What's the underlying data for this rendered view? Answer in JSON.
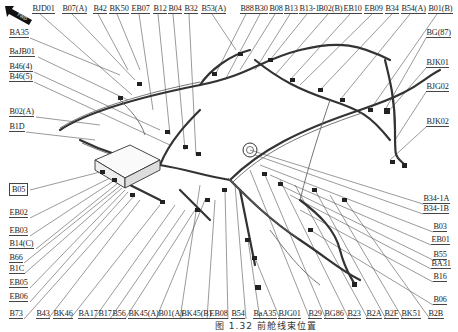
{
  "figure": {
    "caption": "图 1.32 前舱线束位置",
    "direction_indicator": {
      "label": "FWD",
      "icon": "forward-arrow-icon"
    },
    "colors": {
      "line": "#555555",
      "text": "#222222",
      "background": "#ffffff"
    }
  },
  "labels": {
    "top": [
      {
        "text": "BJD01",
        "x": 32,
        "y": 4
      },
      {
        "text": "B07(A)",
        "x": 62,
        "y": 4
      },
      {
        "text": "B42",
        "x": 93,
        "y": 4
      },
      {
        "text": "BK50",
        "x": 109,
        "y": 4
      },
      {
        "text": "EB07",
        "x": 131,
        "y": 4
      },
      {
        "text": "B12",
        "x": 153,
        "y": 4
      },
      {
        "text": "B04",
        "x": 168,
        "y": 4
      },
      {
        "text": "B32",
        "x": 184,
        "y": 4
      },
      {
        "text": "B53(A)",
        "x": 201,
        "y": 4
      },
      {
        "text": "B88",
        "x": 240,
        "y": 4
      },
      {
        "text": "B30",
        "x": 254,
        "y": 4
      },
      {
        "text": "B08",
        "x": 269,
        "y": 4
      },
      {
        "text": "B13",
        "x": 284,
        "y": 4
      },
      {
        "text": "B13-1",
        "x": 299,
        "y": 4
      },
      {
        "text": "B02(B)",
        "x": 318,
        "y": 4
      },
      {
        "text": "EB10",
        "x": 343,
        "y": 4
      },
      {
        "text": "EB09",
        "x": 364,
        "y": 4
      },
      {
        "text": "B34",
        "x": 385,
        "y": 4
      },
      {
        "text": "B54(A)",
        "x": 401,
        "y": 4
      },
      {
        "text": "B01(B)",
        "x": 428,
        "y": 4
      }
    ],
    "left": [
      {
        "text": "BA35",
        "x": 9,
        "y": 28
      },
      {
        "text": "BaJB01",
        "x": 9,
        "y": 47
      },
      {
        "text": "B46(4)",
        "x": 9,
        "y": 62
      },
      {
        "text": "B46(5)",
        "x": 9,
        "y": 72
      },
      {
        "text": "B02(A)",
        "x": 9,
        "y": 107
      },
      {
        "text": "B1D",
        "x": 9,
        "y": 122
      },
      {
        "text": "B05",
        "x": 9,
        "y": 183,
        "boxed": true
      },
      {
        "text": "EB02",
        "x": 9,
        "y": 208
      },
      {
        "text": "EB03",
        "x": 9,
        "y": 226
      },
      {
        "text": "B14(C)",
        "x": 9,
        "y": 239
      },
      {
        "text": "B66",
        "x": 9,
        "y": 253
      },
      {
        "text": "B1C",
        "x": 9,
        "y": 264
      },
      {
        "text": "EB05",
        "x": 9,
        "y": 278
      },
      {
        "text": "EB06",
        "x": 9,
        "y": 292
      },
      {
        "text": "B73",
        "x": 9,
        "y": 309
      }
    ],
    "bottom": [
      {
        "text": "B43",
        "x": 36,
        "y": 309
      },
      {
        "text": "BK46",
        "x": 53,
        "y": 309
      },
      {
        "text": "BA17",
        "x": 78,
        "y": 309
      },
      {
        "text": "B17",
        "x": 98,
        "y": 309
      },
      {
        "text": "B56",
        "x": 112,
        "y": 309
      },
      {
        "text": "BK45(A)",
        "x": 128,
        "y": 309
      },
      {
        "text": "B01(A)",
        "x": 158,
        "y": 309
      },
      {
        "text": "BK45(B)",
        "x": 181,
        "y": 309
      },
      {
        "text": "EB08",
        "x": 209,
        "y": 309
      },
      {
        "text": "B54",
        "x": 231,
        "y": 309
      },
      {
        "text": "BaA35",
        "x": 253,
        "y": 309
      },
      {
        "text": "BJG01",
        "x": 278,
        "y": 309
      },
      {
        "text": "B29",
        "x": 308,
        "y": 309
      },
      {
        "text": "BG86",
        "x": 324,
        "y": 309
      },
      {
        "text": "B23",
        "x": 347,
        "y": 309
      },
      {
        "text": "B2A",
        "x": 366,
        "y": 309
      },
      {
        "text": "B2F",
        "x": 384,
        "y": 309
      },
      {
        "text": "BK51",
        "x": 401,
        "y": 309
      },
      {
        "text": "B2B",
        "x": 428,
        "y": 309
      }
    ],
    "right": [
      {
        "text": "BG(87)",
        "x": 426,
        "y": 28
      },
      {
        "text": "BJK01",
        "x": 426,
        "y": 58
      },
      {
        "text": "BJG02",
        "x": 426,
        "y": 82
      },
      {
        "text": "BJK02",
        "x": 426,
        "y": 117
      },
      {
        "text": "B34-1A",
        "x": 423,
        "y": 194
      },
      {
        "text": "B34-1B",
        "x": 423,
        "y": 204
      },
      {
        "text": "B03",
        "x": 433,
        "y": 222
      },
      {
        "text": "EB01",
        "x": 431,
        "y": 235
      },
      {
        "text": "B55",
        "x": 433,
        "y": 250
      },
      {
        "text": "BA31",
        "x": 431,
        "y": 259
      },
      {
        "text": "B16",
        "x": 433,
        "y": 272
      },
      {
        "text": "B06",
        "x": 433,
        "y": 295
      }
    ]
  }
}
